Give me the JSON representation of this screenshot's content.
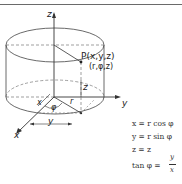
{
  "figure": {
    "type": "cylindrical-coordinates-diagram",
    "axes": {
      "z": "z",
      "y": "y",
      "x": "x"
    },
    "point_label": "P(x,y,z)",
    "point_label_cyl": "(r,φ,z)",
    "dim_labels": {
      "z_height": "z",
      "r": "r",
      "phi": "φ",
      "x_proj": "x",
      "y_proj": "y"
    }
  },
  "equations": [
    "x = r cos φ",
    "y = r sin φ",
    "z = z",
    "tan φ ="
  ],
  "fraction": {
    "numerator": "y",
    "denominator": "x"
  },
  "colors": {
    "line": "#333333",
    "dashed": "#777777",
    "text": "#222222"
  }
}
